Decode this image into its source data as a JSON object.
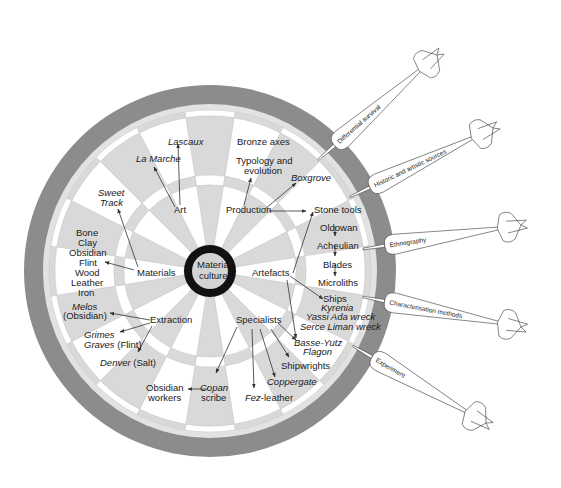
{
  "diagram": {
    "type": "dartboard-concept-map",
    "center_label": [
      "Material",
      "culture"
    ],
    "colors": {
      "outer_ring": "#8c8c8c",
      "light_ring": "#e2e2e2",
      "wedge_light": "#d9d9d9",
      "wedge_white": "#ffffff",
      "bull_ring": "#111111",
      "bull_fill": "#d4d4d4",
      "arrow": "#333333"
    },
    "branches": [
      {
        "label": "Art",
        "examples": [
          {
            "text": "Lascaux",
            "italic": true
          },
          {
            "text": "La Marche",
            "italic": true
          }
        ]
      },
      {
        "label": "Production",
        "examples": [
          {
            "text": "Bronze axes",
            "italic": false
          },
          {
            "text": "Typology and evolution",
            "italic": false
          },
          {
            "text": "Boxgrove",
            "italic": true
          },
          {
            "text": "Stone tools",
            "italic": false
          }
        ]
      },
      {
        "label": "Materials",
        "examples": [
          {
            "text": "Sweet Track",
            "italic": true
          },
          {
            "text": "Bone Clay Obsidian Flint Wood Leather Iron",
            "italic": false
          }
        ]
      },
      {
        "label": "Artefacts",
        "examples": [
          {
            "text": "Stone tools",
            "italic": false
          },
          {
            "text": "Ships",
            "italic": false
          },
          {
            "text": "Basse-Yutz Flagon",
            "italic": true
          }
        ]
      },
      {
        "label": "Extraction",
        "examples": [
          {
            "text": "Melos (Obsidian)",
            "italic": true
          },
          {
            "text": "Grimes Graves (Flint)",
            "italic": true
          },
          {
            "text": "Denver (Salt)",
            "italic": true
          }
        ]
      },
      {
        "label": "Specialists",
        "examples": [
          {
            "text": "Copan scribe",
            "italic": true
          },
          {
            "text": "Fez-leather",
            "italic": true
          },
          {
            "text": "Coppergate",
            "italic": true
          },
          {
            "text": "Shipwrights",
            "italic": false
          },
          {
            "text": "Basse-Yutz Flagon",
            "italic": true
          }
        ]
      }
    ],
    "labels": {
      "lascaux": "Lascaux",
      "la_marche": "La Marche",
      "art": "Art",
      "bronze_axes": "Bronze axes",
      "typology_1": "Typology and",
      "typology_2": "evolution",
      "boxgrove": "Boxgrove",
      "production": "Production",
      "stone_tools": "Stone tools",
      "oldowan": "Oldowan",
      "acheulian": "Acheulian",
      "blades": "Blades",
      "microliths": "Microliths",
      "sweet": "Sweet",
      "track": "Track",
      "bone": "Bone",
      "clay": "Clay",
      "obsidian": "Obsidian",
      "flint": "Flint",
      "wood": "Wood",
      "leather": "Leather",
      "iron": "Iron",
      "materials": "Materials",
      "material": "Material",
      "culture": "culture",
      "artefacts": "Artefacts",
      "ships": "Ships",
      "kyrenia": "Kyrenia",
      "yassi_ada": "Yassi Ada wreck",
      "serce_liman": "Serce Liman wreck",
      "melos": "Melos",
      "melos_obs": "(Obsidian)",
      "extraction": "Extraction",
      "grimes": "Grimes",
      "graves": "Graves",
      "graves_flint": " (Flint)",
      "denver": "Denver",
      "denver_salt": " (Salt)",
      "specialists": "Specialists",
      "basse_yutz": "Basse-Yutz",
      "flagon": "Flagon",
      "shipwrights": "Shipwrights",
      "coppergate": "Coppergate",
      "fez": "Fez",
      "fez_leather": "-leather",
      "obsidian_w": "Obsidian",
      "workers": "workers",
      "copan": "Copan",
      "scribe": "scribe"
    },
    "darts": [
      {
        "label": "Differential survival"
      },
      {
        "label": "Historic and artistic sources"
      },
      {
        "label": "Ethnography"
      },
      {
        "label": "Characterisation methods"
      },
      {
        "label": "Experiment"
      }
    ]
  }
}
